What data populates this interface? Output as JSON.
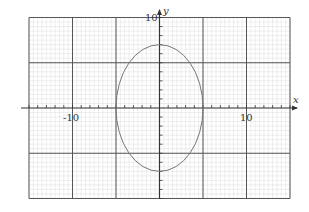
{
  "chart_data": {
    "type": "line",
    "title": "",
    "xlabel": "x",
    "ylabel": "y",
    "xlim": [
      -15,
      15
    ],
    "ylim": [
      -10,
      10
    ],
    "grid": true,
    "major_grid_step": 5,
    "minor_grid_step": 1,
    "tick_labels": {
      "x": [
        "-10",
        "10"
      ],
      "y": [
        "10"
      ]
    },
    "series": [
      {
        "name": "ellipse",
        "equation": "x^2/25 + y^2/49 = 1",
        "center": [
          0,
          0
        ],
        "semi_axis_x": 5,
        "semi_axis_y": 7,
        "points": [
          [
            5,
            0
          ],
          [
            0,
            7
          ],
          [
            -5,
            0
          ],
          [
            0,
            -7
          ]
        ]
      }
    ]
  },
  "labels": {
    "x_axis": "x",
    "y_axis": "y",
    "x_neg10": "-10",
    "x_pos10": "10",
    "y_pos10": "10"
  },
  "colors": {
    "major_grid": "#555555",
    "minor_grid": "#dddddd",
    "axis": "#333333",
    "curve": "#777777"
  }
}
